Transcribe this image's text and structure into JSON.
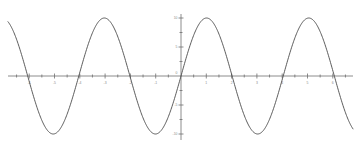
{
  "chart_data": {
    "type": "line",
    "title": "",
    "subtitle": "",
    "xlabel": "",
    "ylabel": "",
    "xlim": [
      -7.0,
      7.0
    ],
    "ylim": [
      -11.5,
      11.5
    ],
    "grid": false,
    "legend": null,
    "x_ticks": [
      {
        "value": -6,
        "label": "-6"
      },
      {
        "value": -5,
        "label": "-5"
      },
      {
        "value": -4,
        "label": "-4"
      },
      {
        "value": -3,
        "label": "-3"
      },
      {
        "value": -2,
        "label": "-2"
      },
      {
        "value": -1,
        "label": "-1"
      },
      {
        "value": 1,
        "label": "1"
      },
      {
        "value": 2,
        "label": "2"
      },
      {
        "value": 3,
        "label": "3"
      },
      {
        "value": 4,
        "label": "4"
      },
      {
        "value": 5,
        "label": "5"
      },
      {
        "value": 6,
        "label": "6"
      }
    ],
    "x_minor_ticks": [
      -6.5,
      -5.5,
      -4.5,
      -3.5,
      -2.5,
      -1.5,
      -0.5,
      0.5,
      1.5,
      2.5,
      3.5,
      4.5,
      5.5,
      6.5
    ],
    "y_ticks": [
      {
        "value": 10,
        "label": "10"
      },
      {
        "value": 5,
        "label": "5"
      },
      {
        "value": -5,
        "label": "-5"
      },
      {
        "value": -10,
        "label": "-10"
      }
    ],
    "y_minor_ticks": [
      -7.5,
      -2.5,
      2.5,
      7.5
    ],
    "origin_label": "0",
    "series": [
      {
        "name": "y = 10 sin(1.555 x)",
        "amplitude": 10,
        "period": 4.04,
        "phase": 0,
        "color": "#4a4a4a",
        "peaks_x": [
          -3.5,
          0.54,
          4.58
        ],
        "troughs_x": [
          -5.52,
          -1.48,
          2.56
        ],
        "zeros_x": [
          -5.52,
          -4.51,
          -2.49,
          -1.48,
          0.0,
          2.02,
          4.04,
          6.06
        ]
      }
    ],
    "axis_color": "#6f6f6f",
    "curve_color": "#4a4a4a",
    "background_color": "#ffffff"
  }
}
